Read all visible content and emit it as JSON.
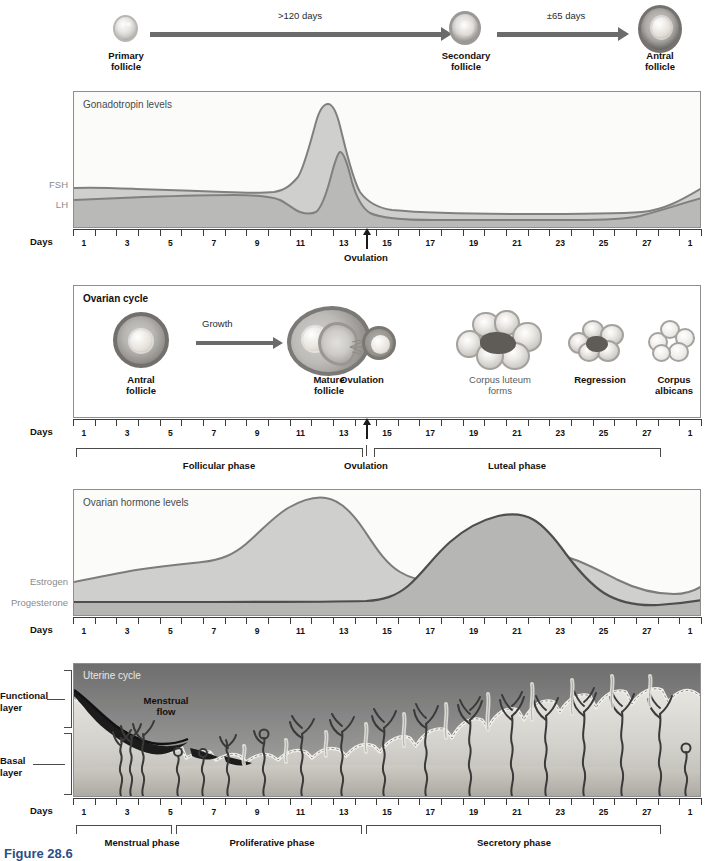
{
  "figure": {
    "caption": "Figure 28.6",
    "days_label": "Days"
  },
  "follicle_development": {
    "stages": [
      {
        "label_line1": "Primary",
        "label_line2": "follicle"
      },
      {
        "label_line1": "Secondary",
        "label_line2": "follicle"
      },
      {
        "label_line1": "Antral",
        "label_line2": "follicle"
      }
    ],
    "arrows": [
      {
        "label": ">120 days"
      },
      {
        "label": "±65 days"
      }
    ]
  },
  "gonadotropin_panel": {
    "title": "Gonadotropin levels",
    "series_labels": [
      "FSH",
      "LH"
    ],
    "ovulation_label": "Ovulation"
  },
  "ovarian_cycle_panel": {
    "title": "Ovarian cycle",
    "growth_arrow_label": "Growth",
    "structures": [
      {
        "label_line1": "Antral",
        "label_line2": "follicle",
        "bold": true
      },
      {
        "label_line1": "Mature",
        "label_line2": "follicle",
        "bold": true
      },
      {
        "label_line1": "Ovulation",
        "label_line2": "",
        "bold": true
      },
      {
        "label_line1": "Corpus luteum",
        "label_line2": "forms",
        "bold": false
      },
      {
        "label_line1": "Regression",
        "label_line2": "",
        "bold": true
      },
      {
        "label_line1": "Corpus",
        "label_line2": "albicans",
        "bold": true
      }
    ],
    "phases": [
      {
        "name": "Follicular phase",
        "start_day": 1,
        "end_day": 14
      },
      {
        "name": "Ovulation",
        "start_day": 14,
        "end_day": 14
      },
      {
        "name": "Luteal phase",
        "start_day": 15,
        "end_day": 28
      }
    ]
  },
  "ovarian_hormone_panel": {
    "title": "Ovarian hormone levels",
    "series_labels": [
      "Estrogen",
      "Progesterone"
    ]
  },
  "uterine_panel": {
    "title": "Uterine cycle",
    "menstrual_flow_label_line1": "Menstrual",
    "menstrual_flow_label_line2": "flow",
    "layer_labels": [
      {
        "line1": "Functional",
        "line2": "layer"
      },
      {
        "line1": "Basal",
        "line2": "layer"
      }
    ],
    "phases": [
      {
        "name": "Menstrual phase",
        "start_day": 1,
        "end_day": 5
      },
      {
        "name": "Proliferative phase",
        "start_day": 6,
        "end_day": 14
      },
      {
        "name": "Secretory phase",
        "start_day": 15,
        "end_day": 28
      }
    ]
  },
  "axis": {
    "label": "Days",
    "tick_days": [
      1,
      2,
      3,
      4,
      5,
      6,
      7,
      8,
      9,
      10,
      11,
      12,
      13,
      14,
      15,
      16,
      17,
      18,
      19,
      20,
      21,
      22,
      23,
      24,
      25,
      26,
      27,
      28,
      1,
      2
    ],
    "labeled_days": [
      1,
      3,
      5,
      7,
      9,
      11,
      13,
      15,
      17,
      19,
      21,
      23,
      25,
      27,
      1
    ]
  },
  "colors": {
    "fill_light": "#d7d7d5",
    "fill_mid": "#c4c4c2",
    "fill_dark": "#b0b0ae",
    "curve_stroke": "#6e6e6e",
    "curve_stroke_dark": "#4b4b4b",
    "axis": "#3c3c3c",
    "text": "#14100e",
    "muted_text": "#8a8a8a",
    "caption": "#2b4f86"
  },
  "chart_data": [
    {
      "type": "area",
      "title": "Gonadotropin levels",
      "xlabel": "Days",
      "ylabel": "",
      "x": [
        1,
        2,
        3,
        4,
        5,
        6,
        7,
        8,
        9,
        10,
        11,
        12,
        13,
        14,
        15,
        16,
        17,
        18,
        19,
        20,
        21,
        22,
        23,
        24,
        25,
        26,
        27,
        28,
        29,
        30
      ],
      "xlim": [
        1,
        30
      ],
      "ylim": [
        0,
        100
      ],
      "grid": false,
      "legend_position": "left-axis",
      "annotations": [
        {
          "text": "Ovulation",
          "day": 14
        }
      ],
      "series": [
        {
          "name": "FSH",
          "values": [
            34,
            33,
            33,
            32,
            32,
            31,
            31,
            31,
            30,
            28,
            25,
            26,
            40,
            66,
            40,
            24,
            20,
            19,
            19,
            18,
            18,
            18,
            18,
            18,
            18,
            19,
            20,
            26,
            33,
            34
          ]
        },
        {
          "name": "LH",
          "values": [
            25,
            26,
            26,
            27,
            27,
            28,
            28,
            28,
            27,
            22,
            17,
            18,
            33,
            95,
            48,
            24,
            15,
            14,
            14,
            13,
            13,
            13,
            13,
            13,
            13,
            14,
            16,
            22,
            30,
            33
          ]
        }
      ]
    },
    {
      "type": "area",
      "title": "Ovarian hormone levels",
      "xlabel": "Days",
      "ylabel": "",
      "x": [
        1,
        2,
        3,
        4,
        5,
        6,
        7,
        8,
        9,
        10,
        11,
        12,
        13,
        14,
        15,
        16,
        17,
        18,
        19,
        20,
        21,
        22,
        23,
        24,
        25,
        26,
        27,
        28,
        29,
        30
      ],
      "xlim": [
        1,
        30
      ],
      "ylim": [
        0,
        100
      ],
      "grid": false,
      "legend_position": "left-axis",
      "series": [
        {
          "name": "Estrogen",
          "values": [
            22,
            24,
            26,
            28,
            30,
            31,
            33,
            38,
            48,
            60,
            72,
            80,
            82,
            74,
            58,
            44,
            36,
            35,
            36,
            38,
            41,
            46,
            52,
            50,
            42,
            33,
            26,
            21,
            20,
            24
          ]
        },
        {
          "name": "Progesterone",
          "values": [
            9,
            9,
            9,
            9,
            9,
            9,
            9,
            9,
            9,
            9,
            9,
            9,
            9,
            10,
            14,
            24,
            36,
            52,
            66,
            78,
            86,
            90,
            88,
            80,
            66,
            48,
            30,
            17,
            11,
            10
          ]
        }
      ]
    }
  ]
}
